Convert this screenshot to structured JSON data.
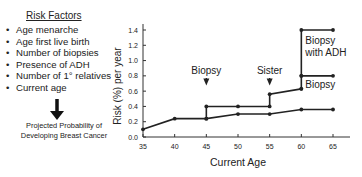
{
  "risk_factors": {
    "title": "Risk Factors",
    "items": [
      "Age menarche",
      "Age first live birth",
      "Number of biopsies",
      "Presence of ADH",
      "Number of 1° relatives",
      "Current age"
    ],
    "bullet": "•",
    "result": [
      "Projected Probability of",
      "Developing Breast Cancer"
    ]
  },
  "chart_data": {
    "type": "line",
    "title": "",
    "xlabel": "Current Age",
    "ylabel": "Risk (%) per year",
    "xlim": [
      35,
      65
    ],
    "ylim": [
      0,
      1.4
    ],
    "xticks": [
      35,
      40,
      45,
      50,
      55,
      60,
      65
    ],
    "yticks": [
      "0.0",
      "0.2",
      "0.4",
      "0.6",
      "0.8",
      "1.0",
      "1.2",
      "1.4"
    ],
    "grid": false,
    "series": [
      {
        "name": "Baseline",
        "points": [
          [
            35,
            0.1
          ],
          [
            40,
            0.24
          ],
          [
            45,
            0.24
          ],
          [
            50,
            0.3
          ],
          [
            55,
            0.3
          ],
          [
            60,
            0.36
          ],
          [
            65,
            0.36
          ]
        ],
        "markers": true
      },
      {
        "name": "After biopsy",
        "points": [
          [
            45,
            0.24
          ],
          [
            45,
            0.4
          ],
          [
            50,
            0.4
          ],
          [
            55,
            0.4
          ],
          [
            55,
            0.56
          ],
          [
            60,
            0.63
          ]
        ],
        "markers": true
      },
      {
        "name": "Second biopsy",
        "points": [
          [
            60,
            0.63
          ],
          [
            60,
            0.8
          ],
          [
            65,
            0.8
          ]
        ],
        "markers": true
      },
      {
        "name": "Biopsy with ADH",
        "points": [
          [
            60,
            0.8
          ],
          [
            60,
            1.4
          ],
          [
            65,
            1.4
          ]
        ],
        "markers": true
      }
    ],
    "annotations": [
      {
        "text": "Biopsy",
        "x": 45,
        "arrow_to_y": 0.7,
        "type": "arrow"
      },
      {
        "text": "Sister",
        "x": 55,
        "arrow_to_y": 0.7,
        "type": "arrow"
      },
      {
        "text": "Biopsy",
        "x": 60,
        "y": 0.72,
        "type": "label"
      },
      {
        "text": "Biopsy with ADH",
        "x": 60,
        "y": 1.3,
        "type": "label"
      }
    ]
  }
}
